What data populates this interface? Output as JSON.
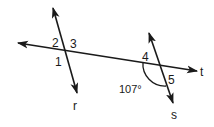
{
  "diagram": {
    "type": "geometry-transversal",
    "lines": {
      "t": {
        "label": "t",
        "role": "transversal"
      },
      "r": {
        "label": "r"
      },
      "s": {
        "label": "s"
      }
    },
    "angle_labels": {
      "a1": "1",
      "a2": "2",
      "a3": "3",
      "a4": "4",
      "a5": "5"
    },
    "given_angle": {
      "value": "107°",
      "marked_with_arc": true
    },
    "colors": {
      "stroke": "#1a1a1a",
      "background": "#ffffff"
    }
  }
}
